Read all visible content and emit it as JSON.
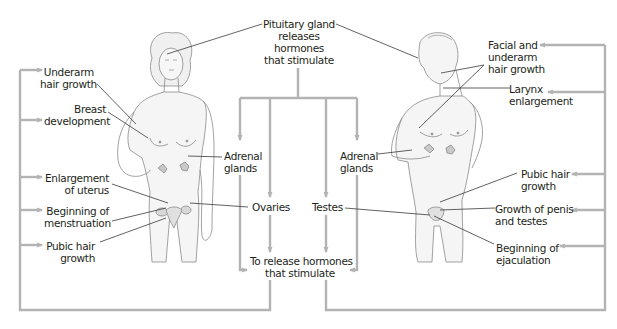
{
  "diagram": {
    "title": "Pituitary gland releases hormones that stimulate",
    "center": {
      "pituitary": [
        "Pituitary gland",
        "releases",
        "hormones",
        "that stimulate"
      ],
      "adrenal_left": [
        "Adrenal",
        "glands"
      ],
      "adrenal_right": [
        "Adrenal",
        "glands"
      ],
      "ovaries": "Ovaries",
      "testes": "Testes",
      "release": [
        "To release hormones",
        "that stimulate"
      ]
    },
    "female": {
      "labels": [
        {
          "id": "underarm",
          "lines": [
            "Underarm",
            "hair growth"
          ]
        },
        {
          "id": "breast",
          "lines": [
            "Breast",
            "development"
          ]
        },
        {
          "id": "uterus",
          "lines": [
            "Enlargement",
            "of uterus"
          ]
        },
        {
          "id": "menstruation",
          "lines": [
            "Beginning of",
            "menstruation"
          ]
        },
        {
          "id": "pubic",
          "lines": [
            "Pubic hair",
            "growth"
          ]
        }
      ]
    },
    "male": {
      "labels": [
        {
          "id": "facial",
          "lines": [
            "Facial and",
            "underarm",
            "hair growth"
          ]
        },
        {
          "id": "larynx",
          "lines": [
            "Larynx",
            "enlargement"
          ]
        },
        {
          "id": "pubic",
          "lines": [
            "Pubic hair",
            "growth"
          ]
        },
        {
          "id": "penis",
          "lines": [
            "Growth of penis",
            "and testes"
          ]
        },
        {
          "id": "ejaculation",
          "lines": [
            "Beginning of",
            "ejaculation"
          ]
        }
      ]
    },
    "colors": {
      "connector": "#b3b3b3",
      "leader": "#3a3a3a",
      "text": "#231f20",
      "skin_outline": "#8a8a8a",
      "skin_fill": "#f3f3f3",
      "gland_fill": "#c9c9c9"
    }
  }
}
